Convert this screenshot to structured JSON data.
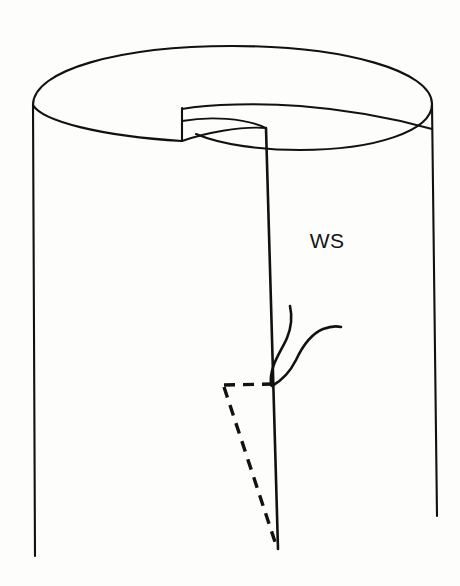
{
  "figure": {
    "background_color": "#fdfdfc",
    "ink_color": "#111111",
    "labels": [
      {
        "id": "ws",
        "text": "WS",
        "x": 327,
        "y": 248,
        "meaning": "surface-step-label"
      }
    ],
    "parts": {
      "cylinder": {
        "name": "cylinder-body",
        "left_edge": {
          "x1": 33,
          "y1": 105,
          "x2": 35,
          "y2": 556
        },
        "right_edge": {
          "x1": 432,
          "y1": 104,
          "x2": 437,
          "y2": 516
        },
        "top_ellipse_rx": 200,
        "top_ellipse_ry": 57
      },
      "spiral_step": {
        "name": "helical-surface-step",
        "riser_x": 182,
        "riser_top_y": 108,
        "riser_bottom_y": 129,
        "inner_ledge_end_x": 278,
        "inner_ledge_end_y": 129
      },
      "dislocation_line": {
        "name": "dislocation-core-line",
        "x1": 266,
        "y1": 128,
        "x2": 278,
        "y2": 549
      },
      "dashed_triangle": {
        "name": "slip-plane-triangle",
        "vertices": [
          {
            "x": 224,
            "y": 385
          },
          {
            "x": 274,
            "y": 384
          },
          {
            "x": 277,
            "y": 548
          }
        ],
        "style": "dashed"
      },
      "squiggles": {
        "name": "step-trace-squiggles",
        "count": 2,
        "origin": {
          "x": 272,
          "y": 384
        }
      }
    }
  }
}
